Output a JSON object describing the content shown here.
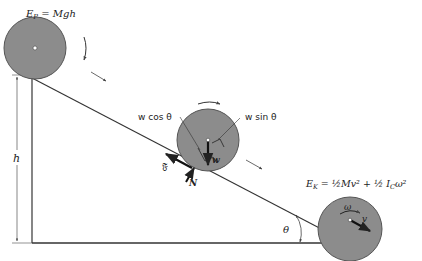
{
  "diagram": {
    "colors": {
      "disk_fill": "#8c8c8c",
      "disk_stroke": "#555555",
      "line": "#333333",
      "background": "#ffffff"
    },
    "labels": {
      "potential_energy": {
        "E": "E",
        "sub": "P",
        "rest": " = Mgh"
      },
      "kinetic_energy": {
        "E": "E",
        "sub": "K",
        "rest": " = ½Mv² + ½ I",
        "sub2": "C",
        "tail": "ω²"
      },
      "height": "h",
      "angle": "θ",
      "w_cos": "w cos θ",
      "w_sin": "w sin θ",
      "weight": "w",
      "friction": "𝔉",
      "normal": "N",
      "omega": "ω",
      "velocity": "v"
    },
    "disks": [
      {
        "name": "top-disk",
        "cx": 35,
        "cy": 48,
        "r": 31
      },
      {
        "name": "middle-disk",
        "cx": 208,
        "cy": 140,
        "r": 31
      },
      {
        "name": "bottom-disk",
        "cx": 350,
        "cy": 229,
        "r": 32
      }
    ]
  }
}
